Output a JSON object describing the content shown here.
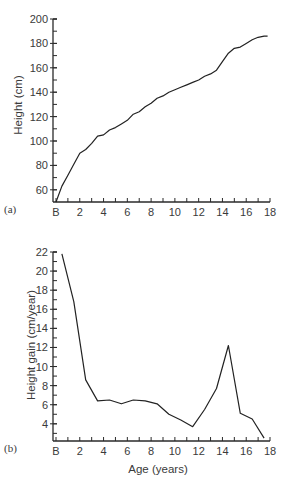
{
  "chart_data": [
    {
      "type": "line",
      "panel_label": "(a)",
      "title": "",
      "xlabel": "",
      "ylabel": "Height (cm)",
      "xlim": [
        0,
        18
      ],
      "ylim": [
        50,
        200
      ],
      "x_ticks": [
        {
          "value": 0,
          "label": "B"
        },
        {
          "value": 2,
          "label": "2"
        },
        {
          "value": 4,
          "label": "4"
        },
        {
          "value": 6,
          "label": "6"
        },
        {
          "value": 8,
          "label": "8"
        },
        {
          "value": 10,
          "label": "10"
        },
        {
          "value": 12,
          "label": "12"
        },
        {
          "value": 14,
          "label": "14"
        },
        {
          "value": 16,
          "label": "16"
        },
        {
          "value": 18,
          "label": "18"
        }
      ],
      "x_minor_step": 1,
      "y_ticks": [
        60,
        80,
        100,
        120,
        140,
        160,
        180,
        200
      ],
      "y_minor_step": 10,
      "grid": false,
      "series": [
        {
          "name": "Height",
          "x": [
            0,
            0.5,
            1,
            1.5,
            2,
            2.5,
            3,
            3.5,
            4,
            4.5,
            5,
            5.5,
            6,
            6.5,
            7,
            7.5,
            8,
            8.5,
            9,
            9.5,
            10,
            10.5,
            11,
            11.5,
            12,
            12.5,
            13,
            13.5,
            14,
            14.5,
            15,
            15.5,
            16,
            16.5,
            17,
            17.5,
            17.8
          ],
          "values": [
            50,
            63,
            72,
            81,
            90,
            93,
            98,
            104,
            105,
            109,
            111,
            114,
            117,
            122,
            124,
            128,
            131,
            135,
            137,
            140,
            142,
            144,
            146,
            148,
            150,
            153,
            155,
            158,
            165,
            172,
            176,
            177,
            180,
            183,
            185,
            186,
            186
          ]
        }
      ]
    },
    {
      "type": "line",
      "panel_label": "(b)",
      "title": "",
      "xlabel": "Age (years)",
      "ylabel": "Height gain (cm/year)",
      "xlim": [
        0,
        18
      ],
      "ylim": [
        2.2,
        22
      ],
      "x_ticks": [
        {
          "value": 0,
          "label": "B"
        },
        {
          "value": 2,
          "label": "2"
        },
        {
          "value": 4,
          "label": "4"
        },
        {
          "value": 6,
          "label": "6"
        },
        {
          "value": 8,
          "label": "8"
        },
        {
          "value": 10,
          "label": "10"
        },
        {
          "value": 12,
          "label": "12"
        },
        {
          "value": 14,
          "label": "14"
        },
        {
          "value": 16,
          "label": "16"
        },
        {
          "value": 18,
          "label": "18"
        }
      ],
      "x_minor_step": 1,
      "y_ticks": [
        4,
        6,
        8,
        10,
        12,
        14,
        16,
        18,
        20,
        22
      ],
      "y_minor_step": 1,
      "grid": false,
      "series": [
        {
          "name": "Height gain",
          "x": [
            0.5,
            1.5,
            2.5,
            3.5,
            4.5,
            5.5,
            6.5,
            7.5,
            8.5,
            9.5,
            10.5,
            11.5,
            12.5,
            13.5,
            14.5,
            15.5,
            16.5,
            17.5
          ],
          "values": [
            21.8,
            16.8,
            8.6,
            6.4,
            6.5,
            6.1,
            6.5,
            6.4,
            6.1,
            5.0,
            4.4,
            3.7,
            5.5,
            7.7,
            12.2,
            5.1,
            4.5,
            2.5
          ]
        }
      ]
    }
  ]
}
